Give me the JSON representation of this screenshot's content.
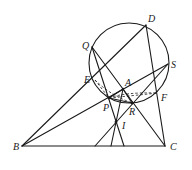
{
  "diagram": {
    "type": "geometry",
    "circle": {
      "cx": 129,
      "cy": 63,
      "r": 40
    },
    "points": {
      "D": {
        "x": 146,
        "y": 25,
        "label": "D",
        "lx": 148,
        "ly": 22
      },
      "Q": {
        "x": 92,
        "y": 47,
        "label": "Q",
        "lx": 82,
        "ly": 49
      },
      "S": {
        "x": 168,
        "y": 64,
        "label": "S",
        "lx": 171,
        "ly": 68
      },
      "E": {
        "x": 95,
        "y": 80,
        "label": "E",
        "lx": 84,
        "ly": 83
      },
      "A": {
        "x": 123,
        "y": 89,
        "label": "A",
        "lx": 125,
        "ly": 86
      },
      "F": {
        "x": 158,
        "y": 93,
        "label": "F",
        "lx": 161,
        "ly": 101
      },
      "P": {
        "x": 109,
        "y": 98,
        "label": "P",
        "lx": 103,
        "ly": 111
      },
      "R": {
        "x": 132,
        "y": 103,
        "label": "R",
        "lx": 129,
        "ly": 115
      },
      "I": {
        "x": 116,
        "y": 122,
        "label": "I",
        "lx": 122,
        "ly": 129
      },
      "B": {
        "x": 22,
        "y": 146,
        "label": "B",
        "lx": 13,
        "ly": 150
      },
      "C": {
        "x": 165,
        "y": 146,
        "label": "C",
        "lx": 170,
        "ly": 150
      }
    },
    "labels": [
      "D",
      "Q",
      "S",
      "E",
      "A",
      "F",
      "P",
      "R",
      "I",
      "B",
      "C"
    ]
  }
}
